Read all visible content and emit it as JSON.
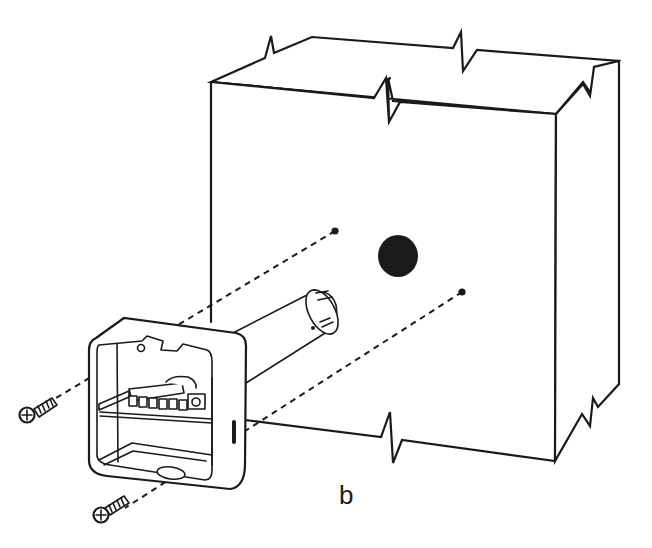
{
  "figure": {
    "label": "b",
    "colors": {
      "line": "#1a1a1a",
      "background": "#ffffff"
    },
    "parts": [
      {
        "name": "wall-section",
        "type": "cut-away block"
      },
      {
        "name": "wall-hole",
        "type": "center hole for sensor probe"
      },
      {
        "name": "drill-mark-upper",
        "type": "screw hole marker"
      },
      {
        "name": "drill-mark-lower",
        "type": "screw hole marker"
      },
      {
        "name": "sensor-housing",
        "type": "square enclosure with terminal block"
      },
      {
        "name": "sensor-probe",
        "type": "cylindrical probe tube"
      },
      {
        "name": "screw-upper",
        "type": "mounting screw"
      },
      {
        "name": "screw-lower",
        "type": "mounting screw"
      }
    ]
  }
}
